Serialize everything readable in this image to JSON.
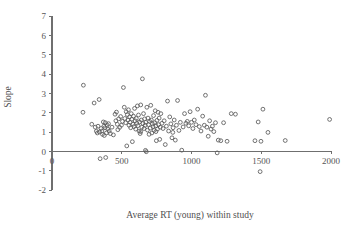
{
  "figure": {
    "background_color": "#ffffff",
    "axis_color": "#6f6f6f",
    "marker_color": "#5a5a5a",
    "text_color": "#4f4f4f"
  },
  "axes": {
    "x_title": "Average RT (young) within study",
    "y_title": "Slope",
    "x_ticks": [
      "0",
      "500",
      "1000",
      "1500",
      "2000"
    ],
    "y_ticks": [
      "7",
      "6",
      "5",
      "4",
      "3",
      "2",
      "1",
      "0",
      "-1",
      "-2"
    ]
  },
  "chart_data": {
    "type": "scatter",
    "title": "",
    "xlabel": "Average RT (young) within study",
    "ylabel": "Slope",
    "xlim": [
      0,
      2000
    ],
    "ylim": [
      -2,
      7
    ],
    "xticks": [
      0,
      500,
      1000,
      1500,
      2000
    ],
    "yticks": [
      -2,
      -1,
      0,
      1,
      2,
      3,
      4,
      5,
      6,
      7
    ],
    "grid": false,
    "legend": null,
    "marker": "open-circle",
    "n_points": 160,
    "points": [
      [
        225,
        3.42
      ],
      [
        222,
        2.02
      ],
      [
        285,
        1.4
      ],
      [
        302,
        2.5
      ],
      [
        310,
        1.25
      ],
      [
        318,
        1.04
      ],
      [
        325,
        0.95
      ],
      [
        330,
        1.3
      ],
      [
        338,
        2.68
      ],
      [
        340,
        1.0
      ],
      [
        345,
        -0.38
      ],
      [
        352,
        1.18
      ],
      [
        358,
        1.05
      ],
      [
        362,
        0.88
      ],
      [
        368,
        1.52
      ],
      [
        372,
        1.3
      ],
      [
        375,
        0.82
      ],
      [
        380,
        1.22
      ],
      [
        385,
        -0.32
      ],
      [
        390,
        0.95
      ],
      [
        395,
        1.36
      ],
      [
        400,
        1.15
      ],
      [
        405,
        1.43
      ],
      [
        410,
        1.05
      ],
      [
        418,
        0.92
      ],
      [
        430,
        1.25
      ],
      [
        440,
        0.85
      ],
      [
        452,
        1.92
      ],
      [
        458,
        1.58
      ],
      [
        462,
        2.03
      ],
      [
        468,
        1.4
      ],
      [
        472,
        1.12
      ],
      [
        478,
        1.68
      ],
      [
        485,
        1.24
      ],
      [
        492,
        1.8
      ],
      [
        498,
        1.35
      ],
      [
        505,
        1.55
      ],
      [
        512,
        3.3
      ],
      [
        518,
        2.28
      ],
      [
        522,
        1.7
      ],
      [
        528,
        1.48
      ],
      [
        532,
        2.05
      ],
      [
        536,
        0.28
      ],
      [
        540,
        1.9
      ],
      [
        545,
        1.62
      ],
      [
        548,
        2.15
      ],
      [
        552,
        1.35
      ],
      [
        556,
        1.78
      ],
      [
        560,
        1.5
      ],
      [
        564,
        1.22
      ],
      [
        568,
        1.95
      ],
      [
        572,
        1.66
      ],
      [
        576,
        0.5
      ],
      [
        580,
        1.4
      ],
      [
        584,
        1.82
      ],
      [
        588,
        1.28
      ],
      [
        592,
        2.22
      ],
      [
        596,
        1.58
      ],
      [
        600,
        1.15
      ],
      [
        604,
        1.7
      ],
      [
        608,
        1.45
      ],
      [
        612,
        2.35
      ],
      [
        616,
        1.33
      ],
      [
        620,
        1.88
      ],
      [
        624,
        1.05
      ],
      [
        628,
        1.52
      ],
      [
        632,
        0.92
      ],
      [
        636,
        2.4
      ],
      [
        640,
        1.62
      ],
      [
        644,
        1.25
      ],
      [
        648,
        3.75
      ],
      [
        652,
        1.44
      ],
      [
        656,
        1.95
      ],
      [
        660,
        1.18
      ],
      [
        664,
        1.68
      ],
      [
        668,
        1.35
      ],
      [
        670,
        0.05
      ],
      [
        672,
        1.5
      ],
      [
        676,
        -0.02
      ],
      [
        680,
        2.28
      ],
      [
        684,
        1.1
      ],
      [
        688,
        1.72
      ],
      [
        692,
        1.38
      ],
      [
        696,
        0.88
      ],
      [
        700,
        1.55
      ],
      [
        704,
        1.2
      ],
      [
        708,
        2.38
      ],
      [
        712,
        1.62
      ],
      [
        716,
        0.95
      ],
      [
        720,
        1.42
      ],
      [
        724,
        1.28
      ],
      [
        728,
        1.85
      ],
      [
        732,
        1.08
      ],
      [
        736,
        1.48
      ],
      [
        740,
        2.1
      ],
      [
        744,
        1.32
      ],
      [
        748,
        0.55
      ],
      [
        752,
        1.6
      ],
      [
        756,
        1.15
      ],
      [
        760,
        2.02
      ],
      [
        764,
        1.38
      ],
      [
        768,
        1.72
      ],
      [
        772,
        0.62
      ],
      [
        776,
        1.25
      ],
      [
        780,
        1.95
      ],
      [
        788,
        1.45
      ],
      [
        796,
        1.18
      ],
      [
        804,
        1.58
      ],
      [
        812,
        0.35
      ],
      [
        820,
        1.3
      ],
      [
        828,
        2.6
      ],
      [
        836,
        1.05
      ],
      [
        844,
        1.78
      ],
      [
        852,
        1.42
      ],
      [
        860,
        0.7
      ],
      [
        868,
        1.22
      ],
      [
        876,
        1.62
      ],
      [
        884,
        0.58
      ],
      [
        892,
        1.35
      ],
      [
        900,
        2.63
      ],
      [
        910,
        1.08
      ],
      [
        920,
        1.5
      ],
      [
        930,
        0.06
      ],
      [
        940,
        1.26
      ],
      [
        950,
        1.95
      ],
      [
        960,
        1.45
      ],
      [
        970,
        1.55
      ],
      [
        980,
        1.32
      ],
      [
        990,
        2.05
      ],
      [
        1000,
        1.5
      ],
      [
        1010,
        1.18
      ],
      [
        1020,
        1.62
      ],
      [
        1032,
        1.38
      ],
      [
        1044,
        2.18
      ],
      [
        1056,
        1.28
      ],
      [
        1068,
        1.05
      ],
      [
        1080,
        1.82
      ],
      [
        1092,
        1.35
      ],
      [
        1100,
        2.9
      ],
      [
        1110,
        1.25
      ],
      [
        1120,
        0.78
      ],
      [
        1130,
        1.58
      ],
      [
        1140,
        1.15
      ],
      [
        1150,
        1.3
      ],
      [
        1160,
        1.02
      ],
      [
        1172,
        1.48
      ],
      [
        1184,
        -0.08
      ],
      [
        1192,
        0.58
      ],
      [
        1210,
        0.55
      ],
      [
        1230,
        1.48
      ],
      [
        1255,
        0.52
      ],
      [
        1285,
        1.95
      ],
      [
        1315,
        1.92
      ],
      [
        1455,
        0.55
      ],
      [
        1478,
        1.52
      ],
      [
        1492,
        -1.05
      ],
      [
        1498,
        0.52
      ],
      [
        1512,
        2.18
      ],
      [
        1548,
        0.98
      ],
      [
        1672,
        0.56
      ],
      [
        1990,
        1.65
      ],
      [
        382,
        1.48
      ],
      [
        636,
        1.02
      ],
      [
        745,
        1.02
      ],
      [
        866,
        0.98
      ]
    ]
  }
}
